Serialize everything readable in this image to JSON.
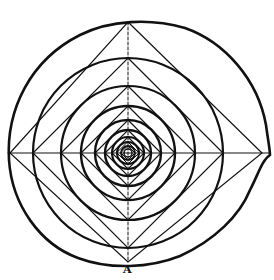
{
  "figure": {
    "type": "geometric construction diagram",
    "label": "A",
    "stroke_color": "#111111",
    "background": "#ffffff",
    "center": [
      128,
      153
    ],
    "nesting_levels": 9
  }
}
